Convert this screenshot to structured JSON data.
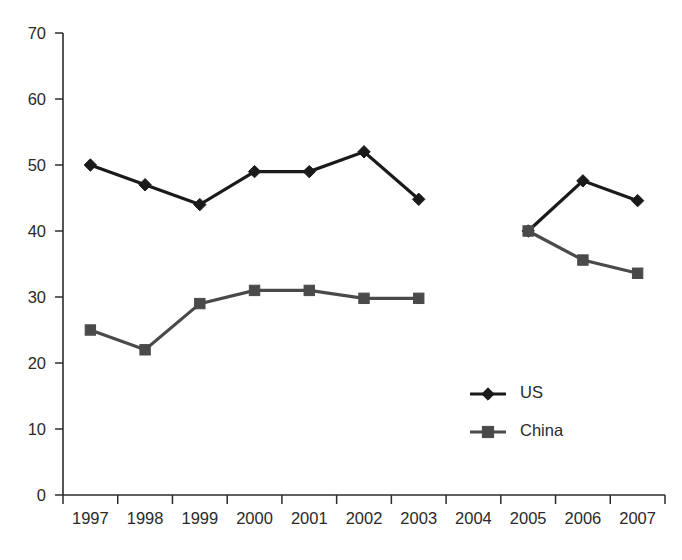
{
  "chart_data": {
    "type": "line",
    "title": "",
    "subtitle": "",
    "xlabel": "",
    "ylabel": "",
    "categories": [
      "1997",
      "1998",
      "1999",
      "2000",
      "2001",
      "2002",
      "2003",
      "2004",
      "2005",
      "2006",
      "2007"
    ],
    "x_tick_labels": [
      "1997",
      "1998",
      "1999",
      "2000",
      "2001",
      "2002",
      "2003",
      "2004",
      "2005",
      "2006",
      "2007"
    ],
    "y_tick_labels": [
      "0",
      "10",
      "20",
      "30",
      "40",
      "50",
      "60",
      "70"
    ],
    "y_ticks": [
      0,
      10,
      20,
      30,
      40,
      50,
      60,
      70
    ],
    "ylim": [
      0,
      70
    ],
    "grid": false,
    "legend_position": "center-right",
    "series": [
      {
        "name": "US",
        "marker": "diamond",
        "color": "#1a1a1a",
        "values": [
          50.0,
          47.0,
          44.0,
          49.0,
          49.0,
          52.0,
          44.8,
          null,
          40.0,
          47.6,
          44.6
        ]
      },
      {
        "name": "China",
        "marker": "square",
        "color": "#4a4a4a",
        "values": [
          25.0,
          22.0,
          29.0,
          31.0,
          31.0,
          29.8,
          29.8,
          null,
          40.0,
          35.6,
          33.6
        ]
      }
    ]
  },
  "legend": {
    "items": [
      {
        "label": "US",
        "color": "#1a1a1a",
        "marker": "diamond"
      },
      {
        "label": "China",
        "color": "#4a4a4a",
        "marker": "square"
      }
    ]
  },
  "axis": {
    "y_color": "#2b2b2b",
    "x_color": "#2b2b2b"
  }
}
